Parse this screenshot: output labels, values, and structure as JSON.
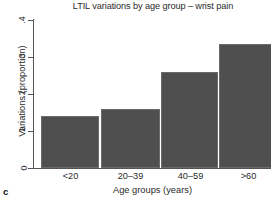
{
  "chart_data": {
    "type": "bar",
    "title": "LTIL variations by age group – wrist pain",
    "xlabel": "Age groups (years)",
    "ylabel": "Variations (proportion)",
    "categories": [
      "<20",
      "20–39",
      "40–59",
      ">60"
    ],
    "values": [
      0.14,
      0.16,
      0.26,
      0.335
    ],
    "ylim": [
      0,
      0.4
    ],
    "ytick_labels": [
      "0",
      ".1",
      ".2",
      ".3",
      ".4"
    ],
    "ytick_values": [
      0,
      0.1,
      0.2,
      0.3,
      0.4
    ],
    "grid": false,
    "legend": null,
    "bar_color": "#4f4f4f",
    "axis_color": "#555555",
    "text_color": "#2b2b2b"
  },
  "panel": {
    "label": "c"
  }
}
